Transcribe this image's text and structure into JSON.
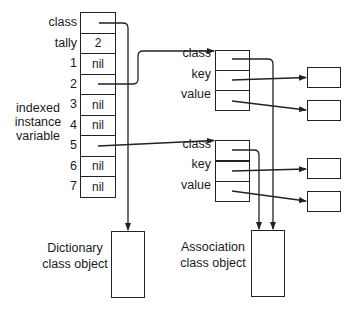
{
  "dictionary": {
    "slots": [
      {
        "label": "class",
        "value": ""
      },
      {
        "label": "tally",
        "value": "2"
      },
      {
        "label": "1",
        "value": "nil"
      },
      {
        "label": "2",
        "value": ""
      },
      {
        "label": "3",
        "value": "nil"
      },
      {
        "label": "4",
        "value": "nil"
      },
      {
        "label": "5",
        "value": ""
      },
      {
        "label": "6",
        "value": "nil"
      },
      {
        "label": "7",
        "value": "nil"
      }
    ],
    "side_label": [
      "indexed",
      "instance",
      "variable"
    ]
  },
  "associations": [
    {
      "fields": [
        "class",
        "key",
        "value"
      ]
    },
    {
      "fields": [
        "class",
        "key",
        "value"
      ]
    }
  ],
  "class_objects": {
    "dictionary": [
      "Dictionary",
      "class object"
    ],
    "association": [
      "Association",
      "class object"
    ]
  },
  "colors": {
    "line": "#222222",
    "background": "#ffffff",
    "text": "#1a1a1a"
  }
}
